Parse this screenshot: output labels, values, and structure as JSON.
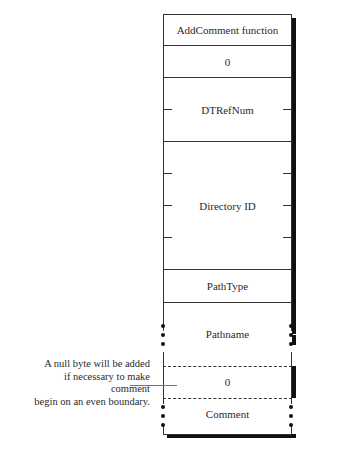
{
  "diagram": {
    "fields": [
      {
        "label": "AddComment function"
      },
      {
        "label": "0"
      },
      {
        "label": "DTRefNum"
      },
      {
        "label": "Directory ID"
      },
      {
        "label": "PathType"
      },
      {
        "label": "Pathname"
      },
      {
        "label": "0"
      },
      {
        "label": "Comment"
      }
    ],
    "annotation": {
      "line1": "A null byte will be added",
      "line2": "if necessary to make comment",
      "line3": "begin on an even boundary."
    }
  }
}
